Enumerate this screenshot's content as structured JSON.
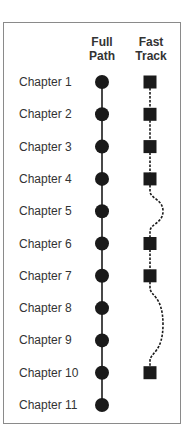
{
  "headers": {
    "full_path": [
      "Full",
      "Path"
    ],
    "fast_track": [
      "Fast",
      "Track"
    ]
  },
  "chapters": [
    {
      "label": "Chapter 1",
      "full_path": true,
      "fast_track": true
    },
    {
      "label": "Chapter 2",
      "full_path": true,
      "fast_track": true
    },
    {
      "label": "Chapter 3",
      "full_path": true,
      "fast_track": true
    },
    {
      "label": "Chapter 4",
      "full_path": true,
      "fast_track": true
    },
    {
      "label": "Chapter 5",
      "full_path": true,
      "fast_track": false
    },
    {
      "label": "Chapter 6",
      "full_path": true,
      "fast_track": true
    },
    {
      "label": "Chapter 7",
      "full_path": true,
      "fast_track": true
    },
    {
      "label": "Chapter 8",
      "full_path": true,
      "fast_track": false
    },
    {
      "label": "Chapter 9",
      "full_path": true,
      "fast_track": false
    },
    {
      "label": "Chapter 10",
      "full_path": true,
      "fast_track": true
    },
    {
      "label": "Chapter 11",
      "full_path": true,
      "fast_track": false
    }
  ],
  "colors": {
    "marker": "#1a1a1a",
    "text": "#333333",
    "frame": "#8a8a8a"
  }
}
